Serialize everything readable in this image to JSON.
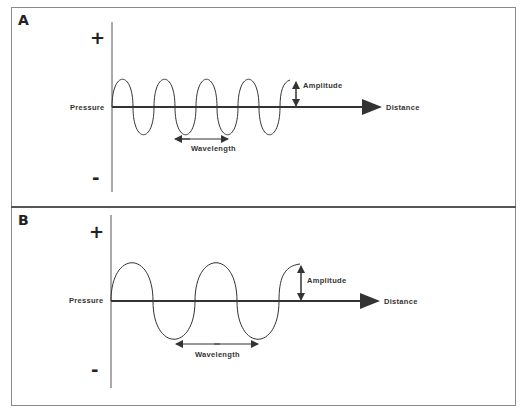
{
  "panels": [
    {
      "label": "A",
      "plus": "+",
      "minus": "-",
      "y_label": "Pressure",
      "x_label": "Distance",
      "amplitude_label": "Amplitude",
      "wavelength_label": "Wavelength",
      "wavelength_px": 42,
      "amplitude_px": 27
    },
    {
      "label": "B",
      "plus": "+",
      "minus": "-",
      "y_label": "Pressure",
      "x_label": "Distance",
      "amplitude_label": "Amplitude",
      "wavelength_label": "Wavelength",
      "wavelength_px": 84,
      "amplitude_px": 38
    }
  ],
  "colors": {
    "line": "#333333",
    "axis": "#555555",
    "frame": "#8a8a8a"
  }
}
